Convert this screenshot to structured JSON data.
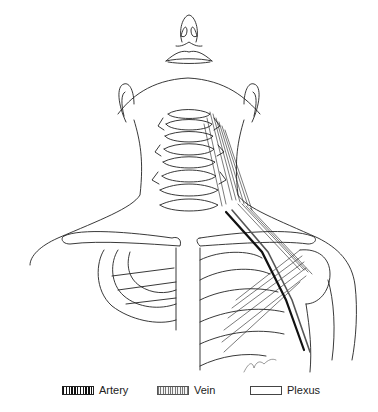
{
  "figure": {
    "signature_mark": "artist-signature"
  },
  "legend": {
    "items": [
      {
        "label": "Artery",
        "pattern": "dense-hatch",
        "color": "#111111"
      },
      {
        "label": "Vein",
        "pattern": "light-hatch",
        "color": "#777777"
      },
      {
        "label": "Plexus",
        "pattern": "empty",
        "color": "#ffffff"
      }
    ]
  }
}
